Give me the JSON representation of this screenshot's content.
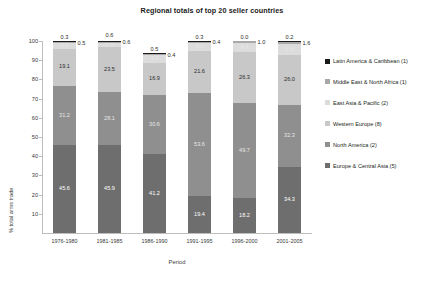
{
  "chart_data": {
    "type": "bar",
    "title": "Regional totals of top 20 seller countries",
    "xlabel": "Period",
    "ylabel": "% total arms trade",
    "ylim": [
      0,
      100
    ],
    "yticks": [
      10,
      20,
      30,
      40,
      50,
      60,
      70,
      80,
      90,
      100
    ],
    "grid": false,
    "stacked": true,
    "stack_mode": "percent",
    "legend_position": "right",
    "categories": [
      "1976-1980",
      "1981-1985",
      "1986-1990",
      "1991-1995",
      "1996-2000",
      "2001-2005"
    ],
    "series": [
      {
        "name": "Europe & Central Asia (5)",
        "color": "#6e6e6e",
        "values": [
          45.6,
          45.9,
          41.2,
          19.4,
          18.2,
          34.3
        ],
        "label_color": "light"
      },
      {
        "name": "North America (2)",
        "color": "#8f8f8f",
        "values": [
          31.2,
          28.1,
          30.6,
          53.6,
          49.7,
          32.3
        ],
        "label_color": "faint"
      },
      {
        "name": "Western Europe (8)",
        "color": "#c8c8c8",
        "values": [
          19.1,
          23.5,
          16.9,
          21.6,
          26.3,
          26.0
        ],
        "label_color": "dark"
      },
      {
        "name": "East Asia & Pacific (2)",
        "color": "#dcdcdc",
        "values": [
          3.3,
          1.9,
          4.0,
          4.7,
          4.8,
          5.6
        ],
        "label_color": "faint"
      },
      {
        "name": "Middle East & North Africa (1)",
        "color": "#a8a8a8",
        "values": [
          0.5,
          0.6,
          0.4,
          0.4,
          1.0,
          1.6
        ],
        "label_color": "callout-side"
      },
      {
        "name": "Latin America & Caribbean (1)",
        "color": "#1a1a1a",
        "values": [
          0.3,
          0.6,
          0.5,
          0.3,
          0.0,
          0.2
        ],
        "label_color": "callout-above"
      }
    ]
  },
  "legend": {
    "items": [
      {
        "label": "Latin America & Caribbean (1)",
        "color": "#1a1a1a"
      },
      {
        "label": "Middle East & North Africa (1)",
        "color": "#a8a8a8"
      },
      {
        "label": "East Asia & Pacific (2)",
        "color": "#dcdcdc"
      },
      {
        "label": "Western Europe (8)",
        "color": "#c8c8c8"
      },
      {
        "label": "North America (2)",
        "color": "#8f8f8f"
      },
      {
        "label": "Europe & Central Asia (5)",
        "color": "#6e6e6e"
      }
    ]
  }
}
